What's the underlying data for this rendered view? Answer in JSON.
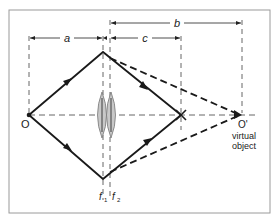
{
  "figure": {
    "labels": {
      "a": "a",
      "b": "b",
      "c": "c",
      "object_point": "O",
      "image_point": "I",
      "virtual_object_point": "O'",
      "virtual_object_caption_line1": "virtual",
      "virtual_object_caption_line2": "object",
      "lens1_focus": "f",
      "lens1_sub": "1",
      "lens2_focus": "f",
      "lens2_sub": "2"
    },
    "colors": {
      "line": "#1a1a1a",
      "dash": "#555555",
      "lens_fill": "#c8c8c8",
      "lens_stroke": "#777777",
      "frame": "#9a9a9a"
    }
  }
}
